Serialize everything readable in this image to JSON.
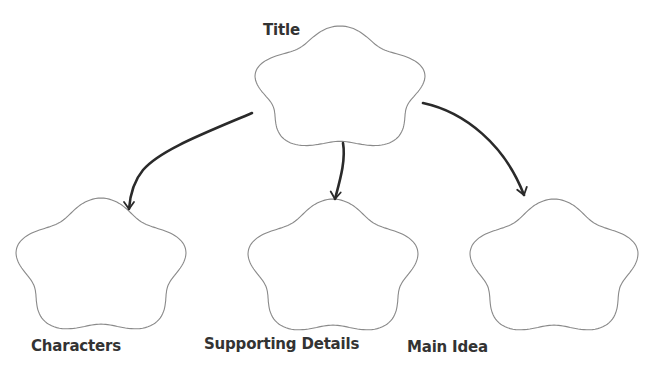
{
  "diagram": {
    "title_label": "Title",
    "nodes": [
      {
        "id": "title",
        "label": "Title",
        "cx": 340,
        "cy": 90,
        "rx": 88,
        "ry": 64,
        "label_x": 263,
        "label_y": 21,
        "label_size": 15
      },
      {
        "id": "characters",
        "label": "Characters",
        "cx": 101,
        "cy": 268,
        "rx": 88,
        "ry": 70,
        "label_x": 31,
        "label_y": 337,
        "label_size": 15
      },
      {
        "id": "supporting-details",
        "label": "Supporting Details",
        "cx": 333,
        "cy": 269,
        "rx": 88,
        "ry": 70,
        "label_x": 204,
        "label_y": 335,
        "label_size": 15
      },
      {
        "id": "main-idea",
        "label": "Main Idea",
        "cx": 554,
        "cy": 269,
        "rx": 87,
        "ry": 70,
        "label_x": 407,
        "label_y": 338,
        "label_size": 15
      }
    ],
    "edges": [
      {
        "from": "title",
        "to": "characters",
        "path": "M252,113 C205,133 160,150 143,170 C133,182 130,196 129,209",
        "tip": [
          129,
          209
        ],
        "dir": [
          0,
          1
        ]
      },
      {
        "from": "title",
        "to": "supporting-details",
        "path": "M343,143 C346,160 340,180 335,199",
        "tip": [
          335,
          199
        ],
        "dir": [
          -0.1,
          1
        ]
      },
      {
        "from": "title",
        "to": "main-idea",
        "path": "M423,103 C465,112 505,145 524,195",
        "tip": [
          524,
          195
        ],
        "dir": [
          0.3,
          1
        ]
      }
    ]
  },
  "colors": {
    "shape_stroke": "#8a8a8a",
    "arrow": "#2a2a2a",
    "text": "#333333",
    "background": "#ffffff"
  }
}
